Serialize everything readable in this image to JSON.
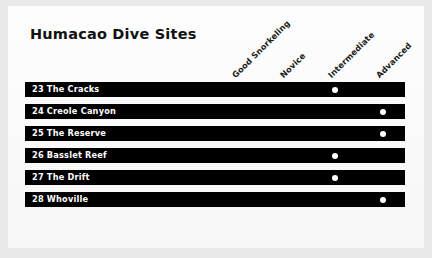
{
  "title": "Humacao Dive Sites",
  "chart_data": {
    "type": "table",
    "title": "Humacao Dive Sites",
    "xlabel": "",
    "ylabel": "",
    "grid": false,
    "legend": "none",
    "columns": [
      "Good Snorkeling",
      "Novice",
      "Intermediate",
      "Advanced"
    ],
    "rows": [
      {
        "number": "23",
        "name": "The Cracks",
        "label": "23 The Cracks",
        "marked": "Novice",
        "values": [
          0,
          1,
          0,
          0
        ]
      },
      {
        "number": "24",
        "name": "Creole Canyon",
        "label": "24 Creole Canyon",
        "marked": "Intermediate",
        "values": [
          0,
          0,
          1,
          0
        ]
      },
      {
        "number": "25",
        "name": "The Reserve",
        "label": "25 The Reserve",
        "marked": "Intermediate",
        "values": [
          0,
          0,
          1,
          0
        ]
      },
      {
        "number": "26",
        "name": "Basslet Reef",
        "label": "26 Basslet Reef",
        "marked": "Novice",
        "values": [
          0,
          1,
          0,
          0
        ]
      },
      {
        "number": "27",
        "name": "The Drift",
        "label": "27 The Drift",
        "marked": "Novice",
        "values": [
          0,
          1,
          0,
          0
        ]
      },
      {
        "number": "28",
        "name": "Whoville",
        "label": "28 Whoville",
        "marked": "Intermediate",
        "values": [
          0,
          0,
          1,
          0
        ]
      }
    ],
    "colors": {
      "bar": "#000000",
      "dot": "#ffffff",
      "text": "#111111",
      "page": "#fbfbfb",
      "canvas": "#e9e9e9"
    }
  },
  "layout": {
    "column_x": [
      237,
      285,
      333,
      381
    ],
    "row_top_start": 82,
    "row_pitch": 22
  }
}
